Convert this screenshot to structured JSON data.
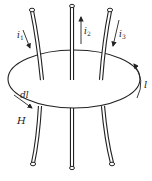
{
  "diagram": {
    "topic": "Ampère's circuital law - closed loop l enclosing currents",
    "labels": {
      "i1": "i",
      "i1_sub": "1",
      "i2": "i",
      "i2_sub": "2",
      "i3": "i",
      "i3_sub": "3",
      "loop": "l",
      "dl": "dl",
      "H": "H"
    },
    "currents": [
      {
        "name": "i1",
        "direction": "down"
      },
      {
        "name": "i2",
        "direction": "up"
      },
      {
        "name": "i3",
        "direction": "down"
      }
    ],
    "loop_direction": "counterclockwise (arrow on right side pointing up)",
    "caption": "",
    "colors": {
      "stroke": "#222222",
      "background": "#ffffff"
    }
  }
}
